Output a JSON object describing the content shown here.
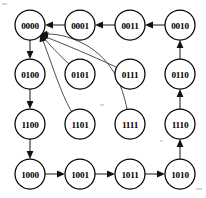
{
  "diagram": {
    "type": "state-transition-graph",
    "width": 206,
    "height": 198,
    "background_color": "#ffffff",
    "node_stroke_color": "#000000",
    "node_fill_color": "#ffffff",
    "edge_color": "#2b2b2b",
    "node_radius": 15,
    "nodes": [
      {
        "id": "0000",
        "label": "0000",
        "cx": 30,
        "cy": 25,
        "row": 0,
        "col": 0
      },
      {
        "id": "0001",
        "label": "0001",
        "cx": 80,
        "cy": 25,
        "row": 0,
        "col": 1
      },
      {
        "id": "0011",
        "label": "0011",
        "cx": 130,
        "cy": 25,
        "row": 0,
        "col": 2
      },
      {
        "id": "0010",
        "label": "0010",
        "cx": 180,
        "cy": 25,
        "row": 0,
        "col": 3
      },
      {
        "id": "0100",
        "label": "0100",
        "cx": 30,
        "cy": 74,
        "row": 1,
        "col": 0
      },
      {
        "id": "0101",
        "label": "0101",
        "cx": 80,
        "cy": 74,
        "row": 1,
        "col": 1
      },
      {
        "id": "0111",
        "label": "0111",
        "cx": 130,
        "cy": 74,
        "row": 1,
        "col": 2
      },
      {
        "id": "0110",
        "label": "0110",
        "cx": 180,
        "cy": 74,
        "row": 1,
        "col": 3
      },
      {
        "id": "1100",
        "label": "1100",
        "cx": 30,
        "cy": 124,
        "row": 2,
        "col": 0
      },
      {
        "id": "1101",
        "label": "1101",
        "cx": 80,
        "cy": 124,
        "row": 2,
        "col": 1
      },
      {
        "id": "1111",
        "label": "1111",
        "cx": 130,
        "cy": 124,
        "row": 2,
        "col": 2
      },
      {
        "id": "1110",
        "label": "1110",
        "cx": 180,
        "cy": 124,
        "row": 2,
        "col": 3
      },
      {
        "id": "1000",
        "label": "1000",
        "cx": 30,
        "cy": 174,
        "row": 3,
        "col": 0
      },
      {
        "id": "1001",
        "label": "1001",
        "cx": 80,
        "cy": 174,
        "row": 3,
        "col": 1
      },
      {
        "id": "1011",
        "label": "1011",
        "cx": 130,
        "cy": 174,
        "row": 3,
        "col": 2
      },
      {
        "id": "1010",
        "label": "1010",
        "cx": 180,
        "cy": 174,
        "row": 3,
        "col": 3
      }
    ],
    "edges": [
      {
        "from": "0001",
        "to": "0000",
        "style": "straight",
        "direction": "left"
      },
      {
        "from": "0011",
        "to": "0001",
        "style": "straight",
        "direction": "left"
      },
      {
        "from": "0010",
        "to": "0011",
        "style": "straight",
        "direction": "left"
      },
      {
        "from": "0000",
        "to": "0100",
        "style": "straight",
        "direction": "down"
      },
      {
        "from": "0100",
        "to": "1100",
        "style": "straight",
        "direction": "down"
      },
      {
        "from": "1100",
        "to": "1000",
        "style": "straight",
        "direction": "down"
      },
      {
        "from": "1000",
        "to": "1001",
        "style": "straight",
        "direction": "right"
      },
      {
        "from": "1001",
        "to": "1011",
        "style": "straight",
        "direction": "right"
      },
      {
        "from": "1011",
        "to": "1010",
        "style": "straight",
        "direction": "right"
      },
      {
        "from": "1010",
        "to": "1110",
        "style": "straight",
        "direction": "up"
      },
      {
        "from": "1110",
        "to": "0110",
        "style": "straight",
        "direction": "up"
      },
      {
        "from": "0110",
        "to": "0010",
        "style": "straight",
        "direction": "up"
      },
      {
        "from": "0101",
        "to": "0000",
        "style": "curved",
        "direction": "up-left"
      },
      {
        "from": "0111",
        "to": "0000",
        "style": "curved",
        "direction": "up-left"
      },
      {
        "from": "1101",
        "to": "0000",
        "style": "curved",
        "direction": "up-left"
      },
      {
        "from": "1111",
        "to": "0000",
        "style": "curved",
        "direction": "up-left"
      }
    ]
  }
}
